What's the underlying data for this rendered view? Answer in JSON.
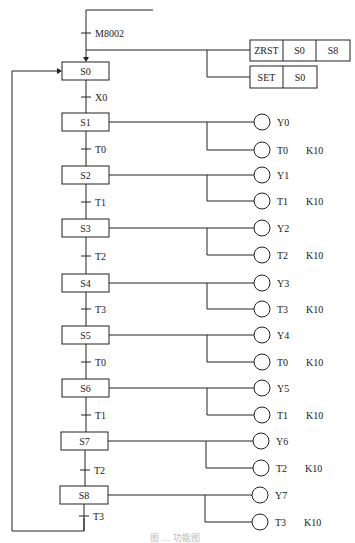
{
  "diagram": {
    "type": "sequential-function-chart",
    "init": {
      "trigger_label": "M8002",
      "zrst": {
        "cells": [
          "ZRST",
          "S0",
          "S8"
        ]
      },
      "set": {
        "cells": [
          "SET",
          "S0"
        ]
      }
    },
    "initial_step": {
      "label": "S0",
      "transition": "X0"
    },
    "steps": [
      {
        "label": "S1",
        "output": "Y0",
        "timer": "T0",
        "timer_const": "K10",
        "transition": "T0"
      },
      {
        "label": "S2",
        "output": "Y1",
        "timer": "T1",
        "timer_const": "K10",
        "transition": "T1"
      },
      {
        "label": "S3",
        "output": "Y2",
        "timer": "T2",
        "timer_const": "K10",
        "transition": "T2"
      },
      {
        "label": "S4",
        "output": "Y3",
        "timer": "T3",
        "timer_const": "K10",
        "transition": "T3"
      },
      {
        "label": "S5",
        "output": "Y4",
        "timer": "T0",
        "timer_const": "K10",
        "transition": "T0"
      },
      {
        "label": "S6",
        "output": "Y5",
        "timer": "T1",
        "timer_const": "K10",
        "transition": "T1"
      },
      {
        "label": "S7",
        "output": "Y6",
        "timer": "T2",
        "timer_const": "K10",
        "transition": "T2"
      },
      {
        "label": "S8",
        "output": "Y7",
        "timer": "T3",
        "timer_const": "K10",
        "transition": "T3"
      }
    ],
    "caption": "图 … 功能图"
  }
}
